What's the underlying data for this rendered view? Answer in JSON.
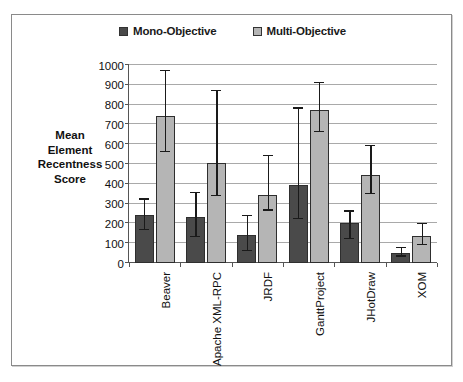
{
  "chart_data": {
    "type": "bar",
    "title": "",
    "xlabel": "",
    "ylabel": "Mean Element Recentness Score",
    "ylabel_lines": [
      "Mean",
      "Element",
      "Recentness",
      "Score"
    ],
    "ylim": [
      0,
      1000
    ],
    "ytick_labels": [
      "0",
      "100",
      "200",
      "300",
      "400",
      "500",
      "600",
      "700",
      "800",
      "900",
      "1000"
    ],
    "ytick_values": [
      0,
      100,
      200,
      300,
      400,
      500,
      600,
      700,
      800,
      900,
      1000
    ],
    "grid": "horizontal",
    "legend_position": "top-center",
    "categories": [
      "Beaver",
      "Apache XML-RPC",
      "JRDF",
      "GanttProject",
      "JHotDraw",
      "XOM"
    ],
    "series": [
      {
        "name": "Mono-Objective",
        "color": "#4a4a4a",
        "values": [
          245,
          230,
          140,
          395,
          200,
          50
        ],
        "err_low": [
          165,
          130,
          60,
          220,
          120,
          32
        ],
        "err_high": [
          320,
          355,
          235,
          780,
          260,
          75
        ]
      },
      {
        "name": "Multi-Objective",
        "color": "#b5b5b5",
        "values": [
          740,
          505,
          345,
          775,
          445,
          137
        ],
        "err_low": [
          560,
          340,
          265,
          660,
          348,
          90
        ],
        "err_high": [
          970,
          870,
          540,
          910,
          590,
          195
        ]
      }
    ]
  },
  "legend": {
    "entries": [
      {
        "label": "Mono-Objective",
        "swatch_color": "#4a4a4a"
      },
      {
        "label": "Multi-Objective",
        "swatch_color": "#b5b5b5"
      }
    ]
  },
  "colors": {
    "mono": "#4a4a4a",
    "multi": "#b5b5b5",
    "grid": "#a9a9a9",
    "axis": "#555555",
    "frame": "#8a8a8a",
    "text": "#111111",
    "background": "#ffffff"
  }
}
